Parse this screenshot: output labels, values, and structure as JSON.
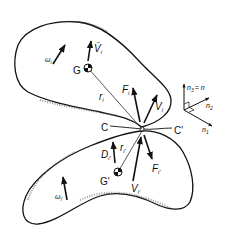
{
  "diagram": {
    "upper_body": {
      "center_label": "G",
      "omega": "ω",
      "omega_sub": "i",
      "velocity_G": "V̄",
      "velocity_G_sub": "i",
      "radius": "r",
      "radius_sub": "i",
      "force": "F",
      "force_sub": "i",
      "velocity_contact": "V",
      "velocity_contact_sub": "i"
    },
    "lower_body": {
      "center_label": "G'",
      "omega": "ω",
      "omega_sub": "i'",
      "velocity_G": "D",
      "velocity_G_sub": "i'",
      "radius": "r",
      "radius_sub": "i'",
      "force": "F",
      "force_sub": "i'",
      "velocity_contact": "V",
      "velocity_contact_sub": "i'"
    },
    "contact": {
      "left_label": "C",
      "right_label": "C'"
    },
    "axes": {
      "n3": "n",
      "n3_sub": "3",
      "n3_eq": "= n",
      "n2": "n",
      "n2_sub": "2",
      "n1": "n",
      "n1_sub": "1"
    }
  }
}
